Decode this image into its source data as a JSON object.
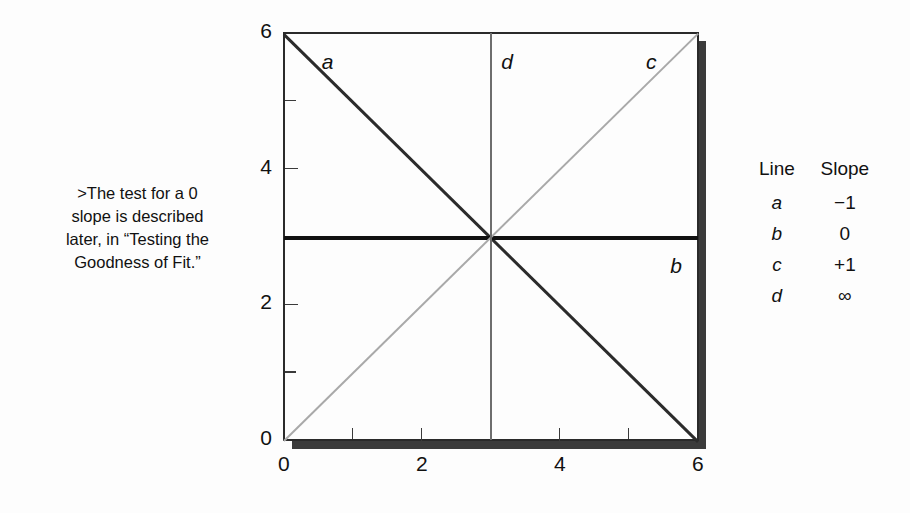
{
  "note": {
    "text": ">The test for a 0\nslope is described\nlater, in “Testing the\nGoodness of Fit.”"
  },
  "legend": {
    "headers": [
      "Line",
      "Slope"
    ],
    "rows": [
      {
        "line": "a",
        "slope": "−1"
      },
      {
        "line": "b",
        "slope": "0"
      },
      {
        "line": "c",
        "slope": "+1"
      },
      {
        "line": "d",
        "slope": "∞"
      }
    ]
  },
  "chart_data": {
    "type": "line",
    "title": "",
    "xlabel": "",
    "ylabel": "",
    "xlim": [
      0,
      6
    ],
    "ylim": [
      0,
      6
    ],
    "grid": false,
    "legend_position": "right",
    "x_ticks_major": [
      0,
      2,
      4,
      6
    ],
    "x_ticks_minor": [
      1,
      3,
      5
    ],
    "y_ticks_major": [
      0,
      2,
      4,
      6
    ],
    "y_ticks_minor": [
      1,
      3,
      5
    ],
    "x_tick_labels": [
      "0",
      "2",
      "4",
      "6"
    ],
    "y_tick_labels": [
      "0",
      "2",
      "4",
      "6"
    ],
    "series": [
      {
        "name": "a",
        "label": "a",
        "slope": "-1",
        "color": "#2b2b2b",
        "points": [
          [
            0,
            6
          ],
          [
            6,
            0
          ]
        ],
        "label_xy": [
          0.55,
          5.55
        ]
      },
      {
        "name": "b",
        "label": "b",
        "slope": "0",
        "color": "#111111",
        "points": [
          [
            0,
            3
          ],
          [
            6,
            3
          ]
        ],
        "label_xy": [
          5.6,
          2.55
        ]
      },
      {
        "name": "c",
        "label": "c",
        "slope": "+1",
        "color": "#a9a9a9",
        "points": [
          [
            0,
            0
          ],
          [
            6,
            6
          ]
        ],
        "label_xy": [
          5.25,
          5.55
        ]
      },
      {
        "name": "d",
        "label": "d",
        "slope": "∞",
        "color": "#6e6e6e",
        "points": [
          [
            3,
            0
          ],
          [
            3,
            6
          ]
        ],
        "label_xy": [
          3.15,
          5.55
        ]
      }
    ]
  }
}
